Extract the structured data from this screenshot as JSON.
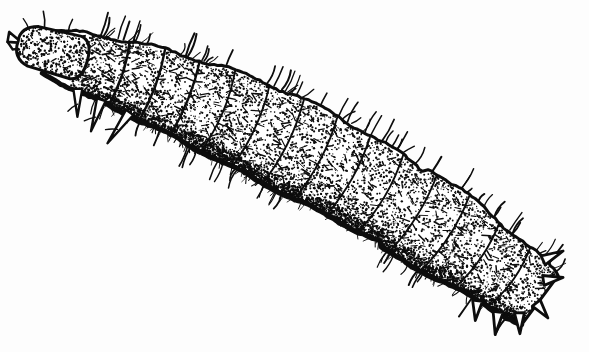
{
  "figure": {
    "view": "lateral",
    "technique": "stippled pen-and-ink line drawing",
    "background_color": "#fdfdfd",
    "ink_color": "#0d0d0d",
    "caption_text": "",
    "caption_visible": false,
    "width_px": 589,
    "height_px": 352
  },
  "anatomy": {
    "head": {
      "label": "head capsule",
      "position": "upper-left",
      "features": [
        "mandible",
        "stippled shading",
        "dark outline"
      ]
    },
    "thorax": {
      "label": "thoracic segments",
      "segment_count": 3,
      "features": [
        "thoracic legs",
        "segment creases",
        "setae"
      ]
    },
    "abdomen": {
      "label": "abdominal segments",
      "segment_count": 9,
      "features": [
        "stippled shading",
        "lateral setae",
        "dorsal setae"
      ]
    },
    "posterior": {
      "label": "posterior terminal segment",
      "position": "lower-right",
      "features": [
        "spine-like projections",
        "anal plate"
      ]
    }
  },
  "body_axis": {
    "head_point": [
      48,
      52
    ],
    "tail_point": [
      540,
      300
    ],
    "curvature": "gentle arc, convex toward upper-right"
  },
  "render_params": {
    "segment_count": 13,
    "stipple_density": 0.55,
    "seta_count": 46,
    "outline_width": 3.0
  }
}
